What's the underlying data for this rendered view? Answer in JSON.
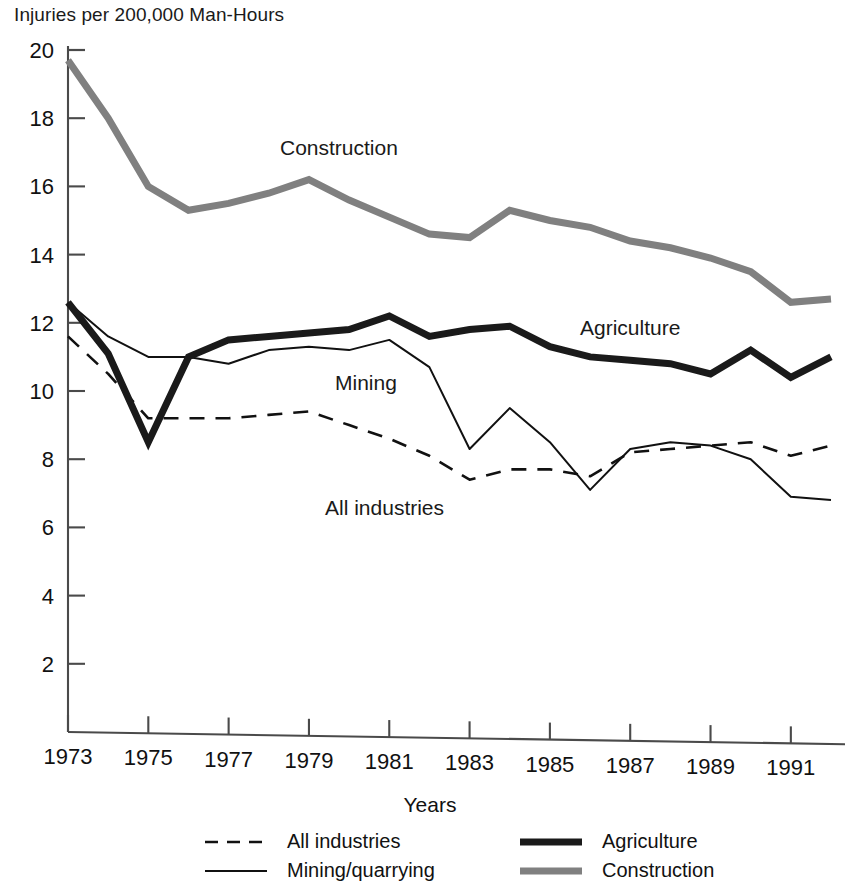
{
  "chart_data": {
    "type": "line",
    "title": "Injuries per 200,000 Man-Hours",
    "xlabel": "Years",
    "ylabel": "Injuries per 200,000 Man-Hours",
    "xlim": [
      1973,
      1992
    ],
    "ylim": [
      0,
      20
    ],
    "grid": false,
    "legend_position": "bottom",
    "x": [
      1973,
      1974,
      1975,
      1976,
      1977,
      1978,
      1979,
      1980,
      1981,
      1982,
      1983,
      1984,
      1985,
      1986,
      1987,
      1988,
      1989,
      1990,
      1991,
      1992
    ],
    "xticks": [
      1973,
      1975,
      1977,
      1979,
      1981,
      1983,
      1985,
      1987,
      1989,
      1991
    ],
    "yticks": [
      2,
      4,
      6,
      8,
      10,
      12,
      14,
      16,
      18,
      20
    ],
    "series": [
      {
        "name": "All industries",
        "style": "dashed",
        "color": "#111111",
        "width": 2.6,
        "values": [
          11.6,
          10.5,
          9.2,
          9.2,
          9.2,
          9.3,
          9.4,
          9.0,
          8.6,
          8.1,
          7.4,
          7.7,
          7.7,
          7.5,
          8.2,
          8.3,
          8.4,
          8.5,
          8.1,
          8.4
        ]
      },
      {
        "name": "Mining/quarrying",
        "style": "solid-thin",
        "color": "#111111",
        "width": 2.0,
        "values": [
          12.6,
          11.6,
          11.0,
          11.0,
          10.8,
          11.2,
          11.3,
          11.2,
          11.5,
          10.7,
          8.3,
          9.5,
          8.5,
          7.1,
          8.3,
          8.5,
          8.4,
          8.0,
          6.9,
          6.8
        ]
      },
      {
        "name": "Agriculture",
        "style": "solid-thick",
        "color": "#1a1a1a",
        "width": 7.0,
        "values": [
          12.6,
          11.1,
          8.5,
          11.0,
          11.5,
          11.6,
          11.7,
          11.8,
          12.2,
          11.6,
          11.8,
          11.9,
          11.3,
          11.0,
          10.9,
          10.8,
          10.5,
          11.2,
          10.4,
          11.0
        ]
      },
      {
        "name": "Construction",
        "style": "solid-thick",
        "color": "#808080",
        "width": 7.0,
        "values": [
          19.7,
          18.0,
          16.0,
          15.3,
          15.5,
          15.8,
          16.2,
          15.6,
          15.1,
          14.6,
          14.5,
          15.3,
          15.0,
          14.8,
          14.4,
          14.2,
          13.9,
          13.5,
          12.6,
          12.7
        ]
      }
    ],
    "inline_labels": [
      {
        "text": "Construction",
        "x": 280,
        "y": 155
      },
      {
        "text": "Agriculture",
        "x": 580,
        "y": 335
      },
      {
        "text": "Mining",
        "x": 335,
        "y": 390
      },
      {
        "text": "All industries",
        "x": 325,
        "y": 515
      }
    ]
  },
  "legend": {
    "entries": [
      {
        "label": "All industries",
        "key": "all-industries"
      },
      {
        "label": "Mining/quarrying",
        "key": "mining-quarrying"
      },
      {
        "label": "Agriculture",
        "key": "agriculture"
      },
      {
        "label": "Construction",
        "key": "construction"
      }
    ]
  }
}
